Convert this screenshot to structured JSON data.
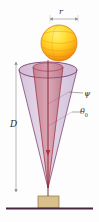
{
  "figure": {
    "name": "sphere-cone-geometry-diagram",
    "background": "#fdfdfd"
  },
  "labels": {
    "radius": "r",
    "distance": "D",
    "psi": "ψ",
    "theta": "θ",
    "theta_subscript": "0"
  },
  "colors": {
    "sphere_highlight": "#ffe24a",
    "sphere_mid": "#ffc21f",
    "sphere_shadow": "#f08a10",
    "sphere_outline": "#d8730a",
    "cone_outer_fill": "#c9a8c9",
    "cone_outer_stroke": "#7a3f6e",
    "cone_inner_fill": "#c4505a",
    "cone_inner_stroke": "#a02030",
    "ground_line": "#4a2540",
    "block_fill": "#d8c08c",
    "block_stroke": "#8a7445",
    "dimension_line": "#9a9a9a",
    "label_text": "#2b2b2b"
  },
  "elements": {
    "sphere_name": "yellow-sphere",
    "cone_outer_name": "outer-cone",
    "cone_inner_name": "inner-cone",
    "block_name": "ground-block",
    "ground_name": "ground-line",
    "r_dimension_name": "radius-dimension-arrow",
    "d_dimension_name": "distance-dimension-arrow",
    "psi_leader_name": "psi-leader-line",
    "theta_leader_name": "theta-leader-line"
  },
  "geometry": {
    "sphere_center_x": 59,
    "sphere_center_y": 43,
    "sphere_radius": 18,
    "cone_apex_x": 48,
    "cone_apex_y": 188,
    "cone_rim_y": 70,
    "cone_rim_half_width": 29,
    "cone_rim_ellipse_ry": 8,
    "r_dim_x1": 50,
    "r_dim_x2": 78,
    "r_dim_y": 19,
    "d_dim_x": 16,
    "d_dim_y1": 62,
    "d_dim_y2": 192,
    "block_x": 38,
    "block_y": 196,
    "block_w": 21,
    "block_h": 12,
    "ground_y": 208,
    "ground_x1": 6,
    "ground_x2": 93
  }
}
